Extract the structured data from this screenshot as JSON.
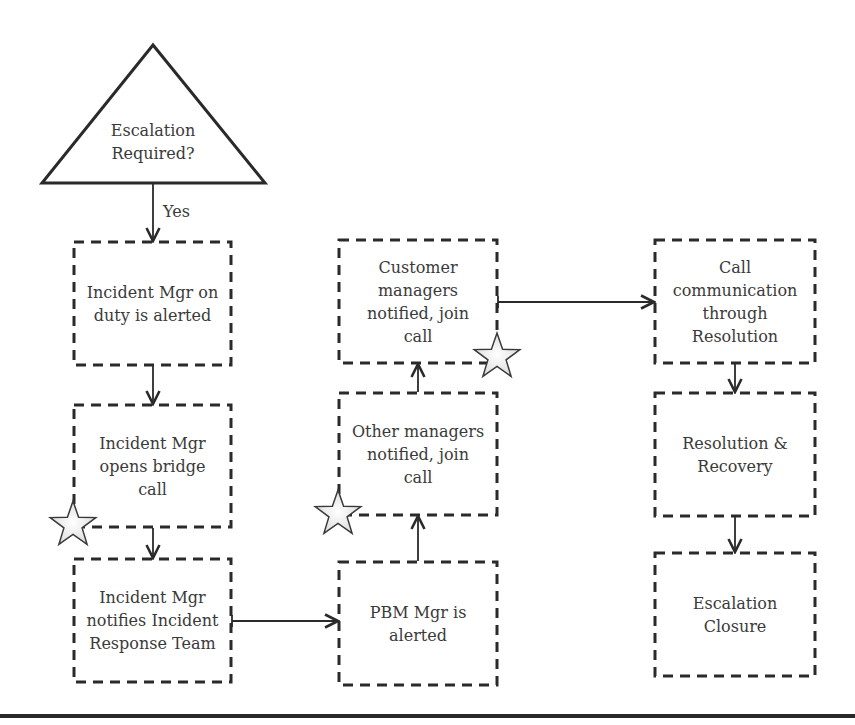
{
  "diagram": {
    "type": "flowchart",
    "decision": {
      "id": "escalation-required",
      "text": "Escalation\nRequired?",
      "shape": "triangle"
    },
    "edge_labels": {
      "yes": "Yes"
    },
    "nodes": [
      {
        "id": "incident-mgr-alerted",
        "text": "Incident Mgr on\nduty is alerted",
        "column": 1
      },
      {
        "id": "incident-mgr-bridge",
        "text": "Incident Mgr\nopens bridge\ncall",
        "column": 1,
        "starred": true
      },
      {
        "id": "incident-mgr-notifies",
        "text": "Incident Mgr\nnotifies Incident\nResponse Team",
        "column": 1
      },
      {
        "id": "pbm-mgr-alerted",
        "text": "PBM Mgr is\nalerted",
        "column": 2
      },
      {
        "id": "other-managers",
        "text": "Other managers\nnotified, join\ncall",
        "column": 2,
        "starred": true
      },
      {
        "id": "customer-managers",
        "text": "Customer\nmanagers\nnotified, join\ncall",
        "column": 2,
        "starred": true
      },
      {
        "id": "call-communication",
        "text": "Call\ncommunication\nthrough\nResolution",
        "column": 3
      },
      {
        "id": "resolution-recovery",
        "text": "Resolution &\nRecovery",
        "column": 3
      },
      {
        "id": "escalation-closure",
        "text": "Escalation\nClosure",
        "column": 3
      }
    ],
    "edges": [
      {
        "from": "escalation-required",
        "to": "incident-mgr-alerted",
        "label": "Yes"
      },
      {
        "from": "incident-mgr-alerted",
        "to": "incident-mgr-bridge"
      },
      {
        "from": "incident-mgr-bridge",
        "to": "incident-mgr-notifies"
      },
      {
        "from": "incident-mgr-notifies",
        "to": "pbm-mgr-alerted"
      },
      {
        "from": "pbm-mgr-alerted",
        "to": "other-managers"
      },
      {
        "from": "other-managers",
        "to": "customer-managers"
      },
      {
        "from": "customer-managers",
        "to": "call-communication"
      },
      {
        "from": "call-communication",
        "to": "resolution-recovery"
      },
      {
        "from": "resolution-recovery",
        "to": "escalation-closure"
      }
    ],
    "colors": {
      "stroke": "#2a2a2a",
      "text": "#3a3a3a",
      "star_fill": "#e6e6e6"
    }
  }
}
